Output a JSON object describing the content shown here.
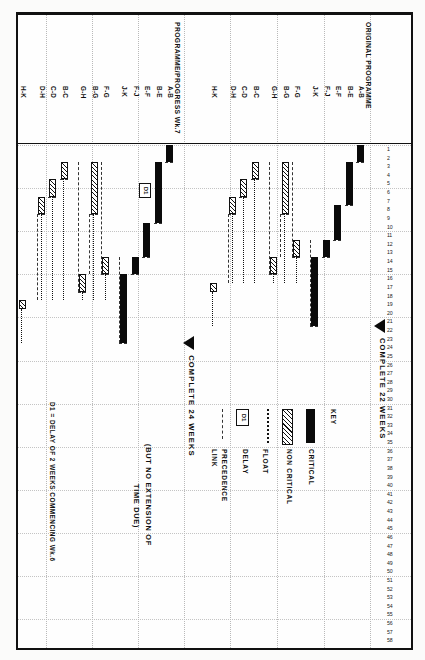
{
  "document": {
    "title": "Construction Programme / Progress Bar Chart",
    "orientation": "landscape-rotated"
  },
  "axis": {
    "label": "Weeks",
    "ticks": [
      "1",
      "2",
      "3",
      "4",
      "5",
      "6",
      "7",
      "8",
      "9",
      "10",
      "11",
      "12",
      "13",
      "14",
      "15",
      "16",
      "17",
      "18",
      "19",
      "20",
      "21",
      "22",
      "23",
      "24",
      "25",
      "26",
      "27",
      "28",
      "29",
      "30",
      "31",
      "32",
      "33",
      "34",
      "35",
      "36",
      "37",
      "38",
      "39",
      "40",
      "41",
      "42",
      "43",
      "44",
      "45",
      "46",
      "47",
      "48",
      "49",
      "50",
      "51",
      "52",
      "53",
      "54",
      "55",
      "56",
      "57",
      "58"
    ],
    "max_week": 58
  },
  "groups": [
    {
      "id": "original",
      "title": "ORIGINAL PROGRAMME",
      "complete_label": "COMPLETE 22 WEEKS",
      "complete_week": 22,
      "rows": [
        {
          "label": "A-B",
          "type": "critical",
          "start": 1,
          "end": 3
        },
        {
          "label": "B-E",
          "type": "critical",
          "start": 3,
          "end": 8
        },
        {
          "label": "E-F",
          "type": "critical",
          "start": 8,
          "end": 12
        },
        {
          "label": "F-J",
          "type": "critical",
          "start": 12,
          "end": 14
        },
        {
          "label": "J-K",
          "type": "critical",
          "start": 14,
          "end": 22
        },
        {
          "label": "F-G",
          "type": "noncritical",
          "start": 12,
          "end": 14,
          "float_to": 17
        },
        {
          "label": "B-G",
          "type": "noncritical",
          "start": 3,
          "end": 9,
          "float_to": 17
        },
        {
          "label": "G-H",
          "type": "noncritical",
          "start": 14,
          "end": 16,
          "float_to": 17
        },
        {
          "label": "B-C",
          "type": "noncritical",
          "start": 3,
          "end": 5,
          "float_to": 17
        },
        {
          "label": "C-D",
          "type": "noncritical",
          "start": 5,
          "end": 7,
          "float_to": 17
        },
        {
          "label": "D-H",
          "type": "noncritical",
          "start": 7,
          "end": 9,
          "float_to": 17
        },
        {
          "label": "H-K",
          "type": "noncritical",
          "start": 17,
          "end": 18,
          "float_to": 22
        }
      ]
    },
    {
      "id": "progress",
      "title": "PROGRAMME/PROGRESS Wk.7",
      "complete_label": "COMPLETE 24 WEEKS",
      "complete_week": 24,
      "delay": {
        "id": "D1",
        "at_week": 6,
        "weeks": 2
      },
      "rows": [
        {
          "label": "A-B",
          "type": "critical",
          "start": 1,
          "end": 3
        },
        {
          "label": "B-E",
          "type": "critical",
          "start": 3,
          "end": 10
        },
        {
          "label": "E-F",
          "type": "critical",
          "start": 10,
          "end": 14
        },
        {
          "label": "F-J",
          "type": "critical",
          "start": 14,
          "end": 16
        },
        {
          "label": "J-K",
          "type": "critical",
          "start": 16,
          "end": 24
        },
        {
          "label": "F-G",
          "type": "noncritical",
          "start": 14,
          "end": 16,
          "float_to": 19
        },
        {
          "label": "B-G",
          "type": "noncritical",
          "start": 3,
          "end": 9,
          "float_to": 19
        },
        {
          "label": "G-H",
          "type": "noncritical",
          "start": 16,
          "end": 18,
          "float_to": 19
        },
        {
          "label": "B-C",
          "type": "noncritical",
          "start": 3,
          "end": 5,
          "float_to": 19
        },
        {
          "label": "C-D",
          "type": "noncritical",
          "start": 5,
          "end": 7,
          "float_to": 19
        },
        {
          "label": "D-H",
          "type": "noncritical",
          "start": 7,
          "end": 9,
          "float_to": 19
        },
        {
          "label": "H-K",
          "type": "noncritical",
          "start": 19,
          "end": 20,
          "float_to": 24
        }
      ]
    }
  ],
  "key": {
    "title": "KEY",
    "items": [
      {
        "label": "CRITICAL",
        "swatch": "critical"
      },
      {
        "label": "NON CRITICAL",
        "swatch": "noncritical"
      },
      {
        "label": "FLOAT",
        "swatch": "float"
      },
      {
        "label": "DELAY",
        "swatch": "delay",
        "text": "D1"
      },
      {
        "label": "PRECEDENCE\nLINK",
        "swatch": "link"
      }
    ],
    "delay_swatch_text": "D1",
    "precedence_line1": "PRECEDENCE",
    "precedence_line2": "LINK"
  },
  "annotations": {
    "extension_note_line1": "(BUT NO EXTENSION OF",
    "extension_note_line2": "TIME DUE)",
    "delay_note": "D1 = DELAY OF 2 WEEKS COMMENCING Wk.6"
  },
  "chart_data": {
    "type": "bar",
    "xlabel": "Weeks",
    "ylabel": "Activity",
    "xlim": [
      1,
      58
    ],
    "grid": true,
    "legend_position": "top-right",
    "categories": [
      "A-B",
      "B-E",
      "E-F",
      "F-J",
      "J-K",
      "F-G",
      "B-G",
      "G-H",
      "B-C",
      "C-D",
      "D-H",
      "H-K"
    ],
    "series": [
      {
        "name": "ORIGINAL PROGRAMME",
        "completion_weeks": 22,
        "bars": [
          {
            "activity": "A-B",
            "start": 1,
            "duration": 2,
            "end": 3,
            "critical": true
          },
          {
            "activity": "B-E",
            "start": 3,
            "duration": 5,
            "end": 8,
            "critical": true
          },
          {
            "activity": "E-F",
            "start": 8,
            "duration": 4,
            "end": 12,
            "critical": true
          },
          {
            "activity": "F-J",
            "start": 12,
            "duration": 2,
            "end": 14,
            "critical": true
          },
          {
            "activity": "J-K",
            "start": 14,
            "duration": 8,
            "end": 22,
            "critical": true
          },
          {
            "activity": "F-G",
            "start": 12,
            "duration": 2,
            "end": 14,
            "critical": false,
            "float_end": 17
          },
          {
            "activity": "B-G",
            "start": 3,
            "duration": 6,
            "end": 9,
            "critical": false,
            "float_end": 17
          },
          {
            "activity": "G-H",
            "start": 14,
            "duration": 2,
            "end": 16,
            "critical": false,
            "float_end": 17
          },
          {
            "activity": "B-C",
            "start": 3,
            "duration": 2,
            "end": 5,
            "critical": false,
            "float_end": 17
          },
          {
            "activity": "C-D",
            "start": 5,
            "duration": 2,
            "end": 7,
            "critical": false,
            "float_end": 17
          },
          {
            "activity": "D-H",
            "start": 7,
            "duration": 2,
            "end": 9,
            "critical": false,
            "float_end": 17
          },
          {
            "activity": "H-K",
            "start": 17,
            "duration": 1,
            "end": 18,
            "critical": false,
            "float_end": 22
          }
        ]
      },
      {
        "name": "PROGRAMME/PROGRESS Wk.7",
        "completion_weeks": 24,
        "delay_weeks": 2,
        "delay_start_week": 6,
        "bars": [
          {
            "activity": "A-B",
            "start": 1,
            "duration": 2,
            "end": 3,
            "critical": true
          },
          {
            "activity": "B-E",
            "start": 3,
            "duration": 7,
            "end": 10,
            "critical": true
          },
          {
            "activity": "E-F",
            "start": 10,
            "duration": 4,
            "end": 14,
            "critical": true
          },
          {
            "activity": "F-J",
            "start": 14,
            "duration": 2,
            "end": 16,
            "critical": true
          },
          {
            "activity": "J-K",
            "start": 16,
            "duration": 8,
            "end": 24,
            "critical": true
          },
          {
            "activity": "F-G",
            "start": 14,
            "duration": 2,
            "end": 16,
            "critical": false,
            "float_end": 19
          },
          {
            "activity": "B-G",
            "start": 3,
            "duration": 6,
            "end": 9,
            "critical": false,
            "float_end": 19
          },
          {
            "activity": "G-H",
            "start": 16,
            "duration": 2,
            "end": 18,
            "critical": false,
            "float_end": 19
          },
          {
            "activity": "B-C",
            "start": 3,
            "duration": 2,
            "end": 5,
            "critical": false,
            "float_end": 19
          },
          {
            "activity": "C-D",
            "start": 5,
            "duration": 2,
            "end": 7,
            "critical": false,
            "float_end": 19
          },
          {
            "activity": "D-H",
            "start": 7,
            "duration": 2,
            "end": 9,
            "critical": false,
            "float_end": 19
          },
          {
            "activity": "H-K",
            "start": 19,
            "duration": 1,
            "end": 20,
            "critical": false,
            "float_end": 24
          }
        ]
      }
    ]
  }
}
